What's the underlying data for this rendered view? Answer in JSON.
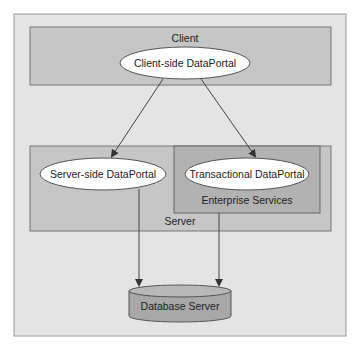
{
  "diagram": {
    "client": {
      "label": "Client",
      "portal": "Client-side DataPortal"
    },
    "server": {
      "label": "Server",
      "portal": "Server-side DataPortal"
    },
    "enterprise": {
      "label": "Enterprise Services",
      "portal": "Transactional DataPortal"
    },
    "database": {
      "label": "Database Server"
    },
    "colors": {
      "canvas": "#e6e6e6",
      "box": "#c8c8c8",
      "enterprise": "#b4b4b4",
      "ellipse": "#ffffff",
      "line": "#555555"
    }
  }
}
